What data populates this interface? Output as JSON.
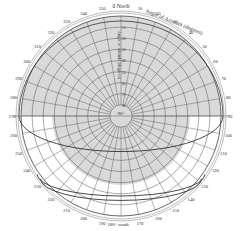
{
  "colors": {
    "shade": "#d9d9d9",
    "grid": "#555555",
    "path": "#333333",
    "background": "#ffffff"
  },
  "chart_data": {
    "type": "polar",
    "labels": {
      "north": "0 North",
      "south": "180° south",
      "center": "90°",
      "azimuth_axis": "Angle of Azimuth (degrees)",
      "altitude_axis": "Angle of altitude (degrees)"
    },
    "azimuth_ticks": [
      0,
      10,
      20,
      30,
      40,
      50,
      60,
      70,
      80,
      90,
      100,
      110,
      120,
      130,
      140,
      150,
      160,
      170,
      180,
      190,
      200,
      210,
      220,
      230,
      240,
      250,
      260,
      270,
      280,
      290,
      300,
      310,
      320,
      330,
      340,
      350
    ],
    "azimuth_tick_labels": [
      "0 North",
      "10",
      "20",
      "30",
      "40",
      "50",
      "60",
      "70",
      "80",
      "90",
      "100",
      "110",
      "120",
      "130",
      "140",
      "150",
      "160",
      "170",
      "180° south",
      "190",
      "200",
      "210",
      "220",
      "230",
      "240",
      "250",
      "260",
      "270",
      "280",
      "290",
      "300",
      "310",
      "320",
      "330",
      "340",
      "350"
    ],
    "altitude_rings": [
      0,
      10,
      20,
      30,
      40,
      50,
      60,
      70,
      80
    ],
    "altitude_labels": [
      "10",
      "20",
      "30",
      "40",
      "50",
      "60",
      "70",
      "80"
    ],
    "altitude_range": [
      0,
      90
    ],
    "shaded_regions": [
      {
        "name": "north-half",
        "azimuth_from": 270,
        "azimuth_to": 90,
        "altitude_min": 0
      },
      {
        "name": "center-disk",
        "altitude_min": 28
      }
    ],
    "sun_paths": [
      {
        "name": "path-1",
        "rise_azimuth": 270,
        "set_azimuth": 90,
        "noon_altitude": 58
      },
      {
        "name": "path-2",
        "rise_azimuth": 235,
        "set_azimuth": 125,
        "noon_altitude": 18
      },
      {
        "name": "path-3",
        "rise_azimuth": 232,
        "set_azimuth": 128,
        "noon_altitude": 14
      }
    ]
  }
}
